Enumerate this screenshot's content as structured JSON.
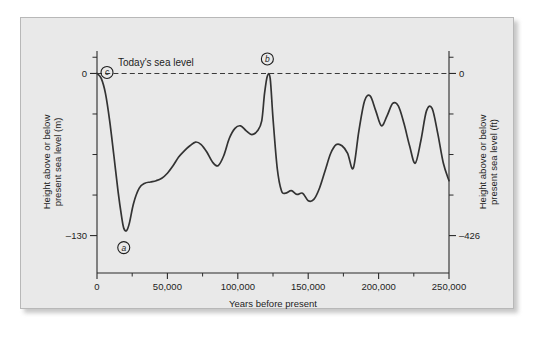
{
  "figure": {
    "panel_background": "#e9e9e9",
    "page_background": "#ffffff",
    "curve_color": "#333333",
    "axis_color": "#2a2a2a"
  },
  "chart_data": {
    "type": "line",
    "title": "",
    "xlabel": "Years before present",
    "ylabel": "Height above or below present sea level (m)",
    "ylabel_right": "Height above or below present sea level (ft)",
    "xlim": [
      0,
      250000
    ],
    "ylim": [
      -160,
      18
    ],
    "grid": false,
    "legend": "none",
    "x_ticks_major": [
      0,
      50000,
      100000,
      150000,
      200000,
      250000
    ],
    "x_ticklabels": [
      "0",
      "50,000",
      "100,000",
      "150,000",
      "200,000",
      "250,000"
    ],
    "x_ticks_minor": [
      25000,
      75000,
      125000,
      175000,
      225000
    ],
    "y_ticks_left_major": [
      0,
      -130
    ],
    "y_ticklabels_left": [
      "0",
      "–130"
    ],
    "y_ticks_left_minor": [
      13,
      -32.5,
      -65,
      -97.5
    ],
    "y_ticks_right_major": [
      0,
      -130
    ],
    "y_ticklabels_right": [
      "0",
      "–426"
    ],
    "y_ticks_right_minor": [
      13,
      -32.5,
      -65,
      -97.5
    ],
    "series": [
      {
        "name": "Sea level curve",
        "x": [
          0,
          3000,
          6000,
          9000,
          12000,
          15000,
          17500,
          19000,
          21000,
          23000,
          26000,
          30000,
          34000,
          38000,
          42000,
          46000,
          50000,
          54000,
          58000,
          62000,
          66000,
          70000,
          74000,
          78000,
          82000,
          86000,
          90000,
          94000,
          98000,
          102000,
          106000,
          110000,
          114000,
          117000,
          119000,
          121000,
          123000,
          125000,
          128000,
          131000,
          134000,
          138000,
          142000,
          146000,
          150000,
          154000,
          158000,
          162000,
          166000,
          170000,
          174000,
          178000,
          182000,
          186000,
          190000,
          194000,
          198000,
          202000,
          206000,
          210000,
          214000,
          218000,
          222000,
          226000,
          230000,
          234000,
          238000,
          242000,
          246000,
          250000
        ],
        "y": [
          0,
          -4,
          -16,
          -38,
          -66,
          -95,
          -115,
          -124,
          -126,
          -120,
          -104,
          -92,
          -88,
          -87,
          -86,
          -84,
          -80,
          -74,
          -67,
          -62,
          -58,
          -55,
          -57,
          -63,
          -71,
          -74,
          -66,
          -52,
          -44,
          -42,
          -46,
          -49,
          -46,
          -38,
          -16,
          -2,
          -4,
          -36,
          -76,
          -94,
          -96,
          -94,
          -97,
          -96,
          -102,
          -101,
          -92,
          -78,
          -64,
          -57,
          -58,
          -64,
          -76,
          -46,
          -22,
          -18,
          -30,
          -42,
          -34,
          -24,
          -26,
          -40,
          -58,
          -72,
          -54,
          -30,
          -28,
          -48,
          -72,
          -86
        ]
      }
    ],
    "annotations": [
      {
        "id": "a",
        "label": "a",
        "x": 19000,
        "y": -126,
        "placement": "below",
        "note": "lowest sea level, last glacial maximum"
      },
      {
        "id": "b",
        "label": "b",
        "x": 121000,
        "y": -2,
        "placement": "above",
        "note": "interglacial high stand"
      },
      {
        "id": "c",
        "label": "c",
        "x": 0,
        "y": 0,
        "placement": "right",
        "note": "today's sea level"
      }
    ],
    "reference_line": {
      "value": 0,
      "style": "dashed",
      "label": "Today's sea level"
    }
  }
}
